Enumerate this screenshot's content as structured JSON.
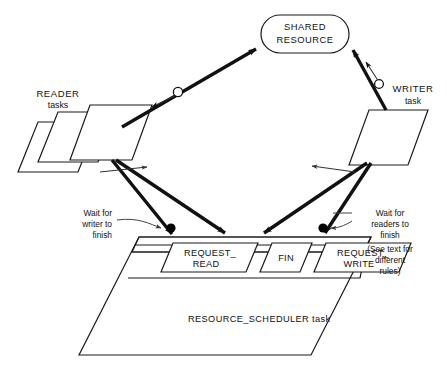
{
  "diagram": {
    "shared_resource": {
      "line1": "SHARED",
      "line2": "RESOURCE"
    },
    "reader": {
      "line1": "READER",
      "line2": "tasks"
    },
    "writer": {
      "line1": "WRITER",
      "line2": "task"
    },
    "entries": [
      {
        "line1": "REQUEST_",
        "line2": "READ"
      },
      {
        "line1": "FIN",
        "line2": ""
      },
      {
        "line1": "REQUEST_",
        "line2": "WRITE"
      }
    ],
    "scheduler_label": "RESOURCE_SCHEDULER task",
    "note_left": {
      "line1": "Wait for",
      "line2": "writer to",
      "line3": "finish"
    },
    "note_right": {
      "line1": "Wait for",
      "line2": "readers to",
      "line3": "finish",
      "line4": "(See text for",
      "line5": "different",
      "line6": "rules)"
    },
    "colors": {
      "stroke": "#1a1a1a",
      "thick": "#111111",
      "background": "#ffffff",
      "dot": "#000000"
    }
  }
}
